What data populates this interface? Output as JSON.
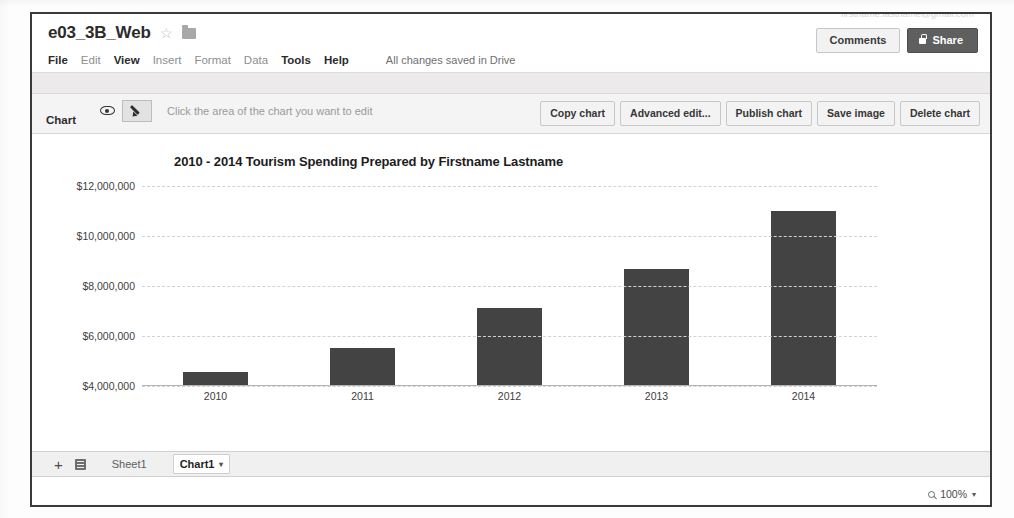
{
  "window": {
    "doc_title": "e03_3B_Web",
    "star_icon": "star-outline-icon",
    "folder_icon": "folder-icon"
  },
  "menubar": {
    "items": [
      {
        "label": "File",
        "enabled": true
      },
      {
        "label": "Edit",
        "enabled": false
      },
      {
        "label": "View",
        "enabled": true
      },
      {
        "label": "Insert",
        "enabled": false
      },
      {
        "label": "Format",
        "enabled": false
      },
      {
        "label": "Data",
        "enabled": false
      },
      {
        "label": "Tools",
        "enabled": true
      },
      {
        "label": "Help",
        "enabled": true
      }
    ],
    "save_status": "All changes saved in Drive"
  },
  "account": {
    "email": "firstname.lastname@gmail.com"
  },
  "header_buttons": {
    "comments": "Comments",
    "share": "Share",
    "share_icon": "lock-icon"
  },
  "chart_toolbar": {
    "label": "Chart",
    "eye_icon": "eye-icon",
    "pencil_icon": "pencil-icon",
    "hint": "Click the area of the chart you want to edit",
    "actions": [
      "Copy chart",
      "Advanced edit...",
      "Publish chart",
      "Save image",
      "Delete chart"
    ]
  },
  "chart_data": {
    "type": "bar",
    "title": "2010 - 2014 Tourism Spending Prepared by Firstname Lastname",
    "xlabel": "",
    "ylabel": "",
    "categories": [
      "2010",
      "2011",
      "2012",
      "2013",
      "2014"
    ],
    "values": [
      4560000,
      5530000,
      7130000,
      8690000,
      11000000
    ],
    "ytick_labels": [
      "$12,000,000",
      "$10,000,000",
      "$8,000,000",
      "$6,000,000",
      "$4,000,000"
    ],
    "ytick_values": [
      12000000,
      10000000,
      8000000,
      6000000,
      4000000
    ],
    "ylim": [
      4000000,
      12000000
    ],
    "grid": true,
    "legend": false,
    "bar_color": "#434343",
    "gridline_color": "#d2d2d2"
  },
  "sheetbar": {
    "add_label": "+",
    "menu_icon": "all-sheets-icon",
    "tabs": [
      {
        "label": "Sheet1",
        "active": false
      },
      {
        "label": "Chart1",
        "active": true
      }
    ],
    "active_caret": "▾"
  },
  "statusbar": {
    "zoom_icon": "magnifier-icon",
    "zoom_level": "100%",
    "zoom_caret": "▾"
  }
}
